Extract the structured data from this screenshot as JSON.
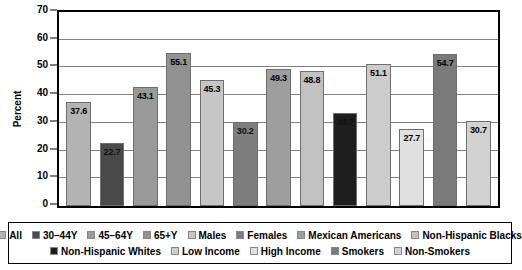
{
  "chart_data": {
    "type": "bar",
    "title": "",
    "xlabel": "",
    "ylabel": "Percent",
    "ylim": [
      0,
      70
    ],
    "ytick_step": 10,
    "yticks": [
      0,
      10,
      20,
      30,
      40,
      50,
      60,
      70
    ],
    "ytick_labels": [
      "0",
      "10",
      "20",
      "30",
      "40",
      "50",
      "60",
      "70"
    ],
    "grid": "horizontal",
    "legend_position": "bottom",
    "categories": [
      "All",
      "30–44Y",
      "45–64Y",
      "65+Y",
      "Males",
      "Females",
      "Mexican Americans",
      "Non-Hispanic Blacks",
      "Non-Hispanic Whites",
      "Low Income",
      "High Income",
      "Smokers",
      "Non-Smokers"
    ],
    "values": [
      37.6,
      22.7,
      43.1,
      55.1,
      45.3,
      30.2,
      49.3,
      48.8,
      33.7,
      51.1,
      27.7,
      54.7,
      30.7
    ],
    "value_labels": [
      "37.6",
      "22.7",
      "43.1",
      "55.1",
      "45.3",
      "30.2",
      "49.3",
      "48.8",
      "33.7",
      "51.1",
      "27.7",
      "54.7",
      "30.7"
    ],
    "colors": [
      "#b3b3b3",
      "#4a4a4a",
      "#9a9a9a",
      "#929292",
      "#c6c6c6",
      "#7d7d7d",
      "#9e9e9e",
      "#c2c2c2",
      "#1e1e1e",
      "#cccccc",
      "#e0e0e0",
      "#7a7a7a",
      "#d2d2d2"
    ],
    "label_contrast": [
      "dark",
      "light",
      "dark",
      "dark",
      "dark",
      "light",
      "dark",
      "dark",
      "light",
      "dark",
      "dark",
      "dark",
      "dark"
    ]
  },
  "legend": {
    "rows": [
      [
        {
          "label": "All",
          "color": "#b3b3b3"
        },
        {
          "label": "30–44Y",
          "color": "#4a4a4a"
        },
        {
          "label": "45–64Y",
          "color": "#9a9a9a"
        },
        {
          "label": "65+Y",
          "color": "#929292"
        },
        {
          "label": "Males",
          "color": "#c6c6c6"
        },
        {
          "label": "Females",
          "color": "#7d7d7d"
        },
        {
          "label": "Mexican Americans",
          "color": "#9e9e9e"
        },
        {
          "label": "Non-Hispanic Blacks",
          "color": "#c2c2c2"
        }
      ],
      [
        {
          "label": "Non-Hispanic Whites",
          "color": "#1e1e1e"
        },
        {
          "label": "Low Income",
          "color": "#cccccc"
        },
        {
          "label": "High Income",
          "color": "#e0e0e0"
        },
        {
          "label": "Smokers",
          "color": "#7a7a7a"
        },
        {
          "label": "Non-Smokers",
          "color": "#d2d2d2"
        }
      ]
    ]
  },
  "colors": {
    "axis": "#000000",
    "gridline": "#808080",
    "background": "#ffffff",
    "text": "#000000"
  }
}
